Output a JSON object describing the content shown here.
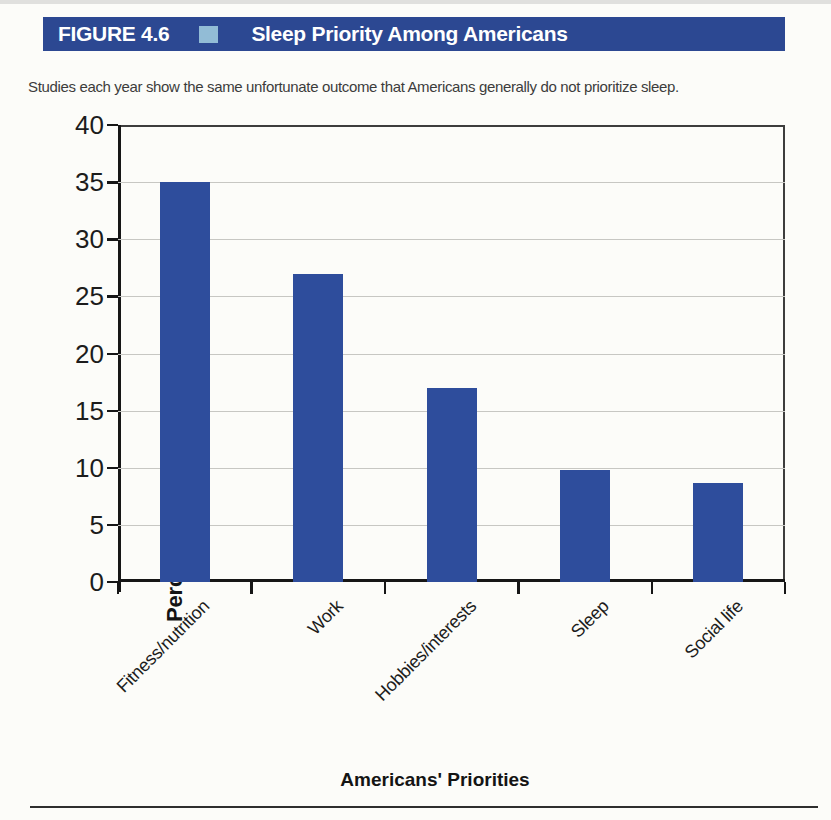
{
  "figure": {
    "label": "FIGURE 4.6",
    "title": "Sleep Priority Among Americans",
    "caption": "Studies each year show the same unfortunate outcome that Americans generally do not prioritize sleep."
  },
  "chart_data": {
    "type": "bar",
    "categories": [
      "Fitness/nutrition",
      "Work",
      "Hobbies/interests",
      "Sleep",
      "Social life"
    ],
    "values": [
      35,
      27,
      17,
      9.8,
      8.7
    ],
    "title": "Sleep Priority Among Americans",
    "xlabel": "Americans' Priorities",
    "ylabel": "Percentage of Respondents",
    "ylim": [
      0,
      40
    ],
    "yticks": [
      0,
      5,
      10,
      15,
      20,
      25,
      30,
      35,
      40
    ],
    "grid": true,
    "legend": "none",
    "bar_color": "#2e4d9c"
  },
  "colors": {
    "header_bar": "#2c4892",
    "header_text": "#ffffff",
    "header_square": "#92bcd6",
    "bar_fill": "#2e4d9c",
    "grid_line": "#c7c7c3",
    "axis": "#161616",
    "page_background": "#fcfcf9"
  }
}
